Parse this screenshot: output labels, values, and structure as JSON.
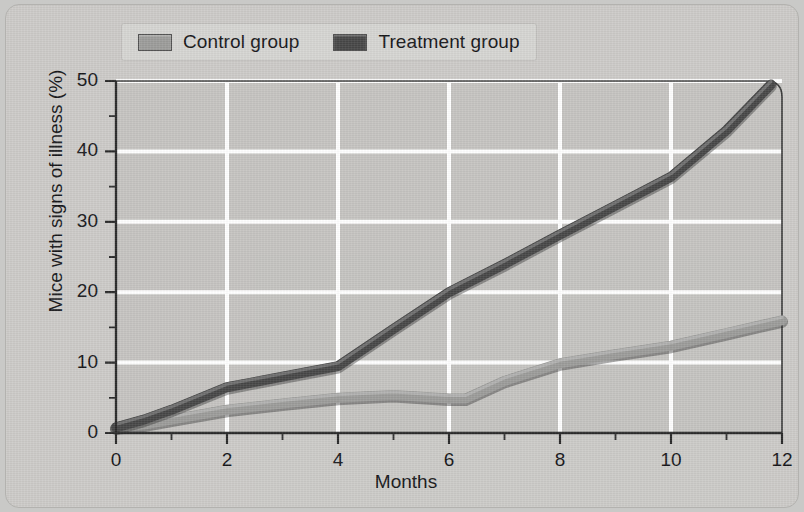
{
  "figure": {
    "background_color": "#cccbc8",
    "plot_background_color": "#c5c4c1",
    "gridline_color": "#ffffff",
    "axis_color": "#2b2b2b"
  },
  "legend": {
    "position": "top-left-inside",
    "background_color": "#d6d5d2",
    "items": [
      {
        "label": "Control group",
        "color": "#9c9c9a",
        "swatch_name": "control-group-swatch"
      },
      {
        "label": "Treatment group",
        "color": "#474747",
        "swatch_name": "treatment-group-swatch"
      }
    ]
  },
  "chart_data": {
    "type": "line",
    "title": "",
    "subtitle": "",
    "xlabel": "Months",
    "ylabel": "Mice with signs of illness (%)",
    "xlim": [
      0,
      12
    ],
    "ylim": [
      0,
      50
    ],
    "x_ticks": [
      0,
      2,
      4,
      6,
      8,
      10,
      12
    ],
    "x_tick_labels": [
      "0",
      "2",
      "4",
      "6",
      "8",
      "10",
      "12"
    ],
    "x_minor_ticks": [
      1,
      3,
      5,
      7,
      9,
      11
    ],
    "y_ticks": [
      0,
      10,
      20,
      30,
      40,
      50
    ],
    "y_tick_labels": [
      "0",
      "10",
      "20",
      "30",
      "40",
      "50"
    ],
    "y_minor_ticks": [
      5,
      15,
      25,
      35,
      45
    ],
    "grid": true,
    "grid_axes": "both",
    "legend_position": "top-left",
    "series": [
      {
        "name": "Control group",
        "color": "#9c9c9a",
        "x": [
          0,
          0.5,
          1,
          2,
          3,
          4,
          5,
          6,
          6.3,
          7,
          8,
          9,
          10,
          11,
          12
        ],
        "values": [
          0.8,
          1.2,
          1.9,
          3.3,
          4.2,
          5.0,
          5.4,
          4.9,
          4.9,
          7.4,
          9.9,
          11.2,
          12.4,
          14.2,
          16.0
        ]
      },
      {
        "name": "Treatment group",
        "color": "#474747",
        "x": [
          0,
          0.5,
          1,
          2,
          3,
          4,
          5,
          6,
          7,
          8,
          9,
          10,
          11,
          11.8
        ],
        "values": [
          0.8,
          1.9,
          3.3,
          6.5,
          8.0,
          9.5,
          14.8,
          20.0,
          24.0,
          28.2,
          32.3,
          36.4,
          43.0,
          49.5
        ]
      }
    ]
  }
}
